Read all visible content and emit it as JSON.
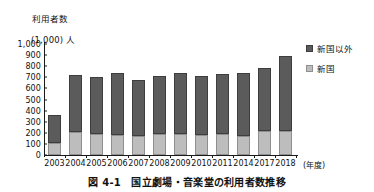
{
  "axis_title": {
    "line1": "利用者数",
    "line2": "(1,000) 人"
  },
  "legend": {
    "items": [
      {
        "label": "新国以外",
        "color": "#5b5b5b",
        "key": "other"
      },
      {
        "label": "新国",
        "color": "#bdbdbd",
        "key": "shinkoku"
      }
    ]
  },
  "x_unit": "(年度)",
  "caption": "図 4-1　国立劇場・音楽堂の利用者数推移",
  "chart_data": {
    "type": "bar",
    "stacked": true,
    "title": "図 4-1　国立劇場・音楽堂の利用者数推移",
    "xlabel": "(年度)",
    "ylabel": "利用者数 (1,000) 人",
    "ylim": [
      0,
      1000
    ],
    "yticks": [
      "0",
      "100",
      "200",
      "300",
      "400",
      "500",
      "600",
      "700",
      "800",
      "900",
      "1,000"
    ],
    "ytick_values": [
      0,
      100,
      200,
      300,
      400,
      500,
      600,
      700,
      800,
      900,
      1000
    ],
    "grid": false,
    "legend_position": "right",
    "categories": [
      "2003",
      "2004",
      "2005",
      "2006",
      "2007",
      "2008",
      "2009",
      "2010",
      "2011",
      "2014",
      "2017",
      "2018"
    ],
    "series": [
      {
        "name": "新国",
        "color": "#bdbdbd",
        "values": [
          110,
          205,
          185,
          178,
          175,
          188,
          188,
          178,
          188,
          172,
          212,
          215
        ]
      },
      {
        "name": "新国以外",
        "color": "#5b5b5b",
        "values": [
          255,
          520,
          520,
          558,
          503,
          528,
          550,
          530,
          540,
          567,
          573,
          680
        ]
      }
    ],
    "totals": [
      365,
      725,
      705,
      736,
      678,
      716,
      738,
      708,
      728,
      739,
      785,
      895
    ]
  }
}
